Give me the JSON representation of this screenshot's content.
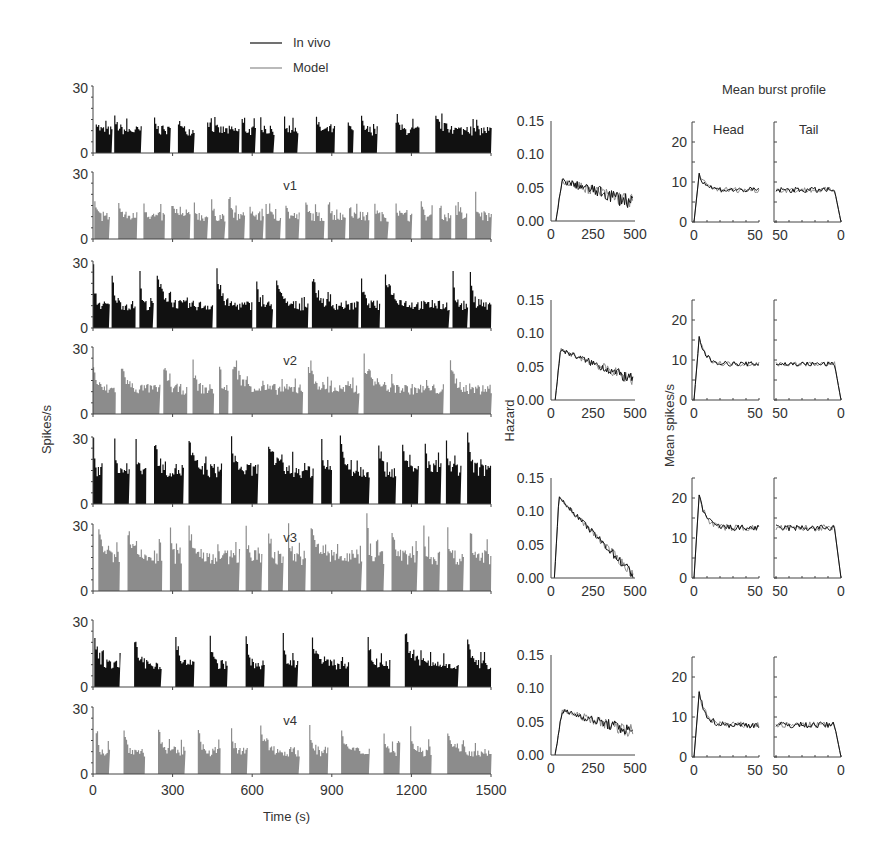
{
  "chart_data": [
    {
      "type": "bar",
      "title": "Spike rate histograms (in vivo vs model)",
      "xlabel": "Time (s)",
      "ylabel": "Spikes/s",
      "xlim": [
        0,
        1500
      ],
      "ylim": [
        0,
        30
      ],
      "xticks": [
        0,
        300,
        600,
        900,
        1200,
        1500
      ],
      "yticks": [
        0,
        30
      ],
      "legend": [
        {
          "name": "In vivo",
          "color": "#111111"
        },
        {
          "name": "Model",
          "color": "#8c8c8c"
        }
      ],
      "panels": [
        {
          "group": "v1",
          "series": "In vivo",
          "level": 10,
          "peak": 15,
          "bursts": [
            [
              10,
              70
            ],
            [
              80,
              180
            ],
            [
              230,
              290
            ],
            [
              320,
              380
            ],
            [
              430,
              550
            ],
            [
              560,
              610
            ],
            [
              630,
              680
            ],
            [
              720,
              770
            ],
            [
              840,
              910
            ],
            [
              960,
              980
            ],
            [
              1010,
              1070
            ],
            [
              1140,
              1230
            ],
            [
              1290,
              1500
            ]
          ]
        },
        {
          "group": "v1",
          "series": "Model",
          "level": 10,
          "peak": 16,
          "bursts": [
            [
              5,
              60
            ],
            [
              95,
              165
            ],
            [
              190,
              270
            ],
            [
              295,
              365
            ],
            [
              380,
              430
            ],
            [
              445,
              495
            ],
            [
              510,
              570
            ],
            [
              590,
              640
            ],
            [
              650,
              705
            ],
            [
              725,
              775
            ],
            [
              800,
              870
            ],
            [
              885,
              950
            ],
            [
              965,
              1040
            ],
            [
              1060,
              1110
            ],
            [
              1140,
              1200
            ],
            [
              1235,
              1280
            ],
            [
              1305,
              1350
            ],
            [
              1365,
              1410
            ],
            [
              1440,
              1500
            ]
          ]
        },
        {
          "group": "v2",
          "series": "In vivo",
          "level": 10,
          "peak": 23,
          "bursts": [
            [
              0,
              60
            ],
            [
              70,
              160
            ],
            [
              175,
              225
            ],
            [
              240,
              450
            ],
            [
              465,
              600
            ],
            [
              615,
              675
            ],
            [
              690,
              810
            ],
            [
              825,
              1000
            ],
            [
              1010,
              1080
            ],
            [
              1100,
              1340
            ],
            [
              1355,
              1410
            ],
            [
              1420,
              1500
            ]
          ]
        },
        {
          "group": "v2",
          "series": "Model",
          "level": 11,
          "peak": 22,
          "bursts": [
            [
              0,
              85
            ],
            [
              105,
              250
            ],
            [
              265,
              355
            ],
            [
              375,
              455
            ],
            [
              475,
              510
            ],
            [
              525,
              790
            ],
            [
              810,
              1000
            ],
            [
              1020,
              1320
            ],
            [
              1345,
              1500
            ]
          ]
        },
        {
          "group": "v3",
          "series": "In vivo",
          "level": 15,
          "peak": 29,
          "bursts": [
            [
              0,
              35
            ],
            [
              80,
              135
            ],
            [
              160,
              200
            ],
            [
              230,
              340
            ],
            [
              360,
              485
            ],
            [
              520,
              620
            ],
            [
              660,
              830
            ],
            [
              860,
              900
            ],
            [
              930,
              1040
            ],
            [
              1075,
              1140
            ],
            [
              1165,
              1225
            ],
            [
              1250,
              1310
            ],
            [
              1330,
              1385
            ],
            [
              1410,
              1500
            ]
          ]
        },
        {
          "group": "v3",
          "series": "Model",
          "level": 15,
          "peak": 27,
          "bursts": [
            [
              20,
              100
            ],
            [
              130,
              260
            ],
            [
              290,
              335
            ],
            [
              360,
              550
            ],
            [
              575,
              635
            ],
            [
              660,
              715
            ],
            [
              735,
              800
            ],
            [
              820,
              1010
            ],
            [
              1030,
              1095
            ],
            [
              1125,
              1220
            ],
            [
              1245,
              1305
            ],
            [
              1335,
              1395
            ],
            [
              1420,
              1500
            ]
          ]
        },
        {
          "group": "v4",
          "series": "In vivo",
          "level": 10,
          "peak": 22,
          "bursts": [
            [
              5,
              100
            ],
            [
              155,
              255
            ],
            [
              310,
              380
            ],
            [
              440,
              505
            ],
            [
              575,
              645
            ],
            [
              715,
              770
            ],
            [
              825,
              965
            ],
            [
              1035,
              1120
            ],
            [
              1175,
              1375
            ],
            [
              1410,
              1500
            ]
          ]
        },
        {
          "group": "v4",
          "series": "Model",
          "level": 10,
          "peak": 20,
          "bursts": [
            [
              10,
              60
            ],
            [
              115,
              195
            ],
            [
              245,
              345
            ],
            [
              395,
              480
            ],
            [
              520,
              580
            ],
            [
              630,
              775
            ],
            [
              815,
              885
            ],
            [
              935,
              1040
            ],
            [
              1095,
              1155
            ],
            [
              1195,
              1275
            ],
            [
              1335,
              1500
            ]
          ]
        }
      ]
    },
    {
      "type": "line",
      "title": "Hazard",
      "ylabel": "Hazard",
      "xlim": [
        0,
        500
      ],
      "ylim": [
        0,
        0.15
      ],
      "xticks": [
        0,
        250,
        500
      ],
      "yticks": [
        0.0,
        0.05,
        0.1,
        0.15
      ],
      "rows": [
        {
          "group": "v1",
          "onset": 30,
          "peak_x": 70,
          "peak": 0.06,
          "end": 0.028,
          "noise": 0.01
        },
        {
          "group": "v2",
          "onset": 25,
          "peak_x": 60,
          "peak": 0.075,
          "end": 0.03,
          "noise": 0.007
        },
        {
          "group": "v3",
          "onset": 20,
          "peak_x": 50,
          "peak": 0.12,
          "end": 0.005,
          "noise": 0.006
        },
        {
          "group": "v4",
          "onset": 25,
          "peak_x": 70,
          "peak": 0.066,
          "end": 0.035,
          "noise": 0.008
        }
      ]
    },
    {
      "type": "line",
      "title": "Mean burst profile",
      "ylabel": "Mean spikes/s",
      "ylim": [
        0,
        25
      ],
      "yticks": [
        0,
        10,
        20
      ],
      "subpanels": [
        {
          "name": "Head",
          "xlim": [
            0,
            50
          ],
          "xticks": [
            0,
            50
          ]
        },
        {
          "name": "Tail",
          "xlim": [
            50,
            0
          ],
          "xticks": [
            50,
            0
          ]
        }
      ],
      "rows": [
        {
          "group": "v1",
          "head_peak": 12,
          "plateau": 8,
          "noise": 0.7
        },
        {
          "group": "v2",
          "head_peak": 15.5,
          "plateau": 9,
          "noise": 0.6
        },
        {
          "group": "v3",
          "head_peak": 21,
          "plateau": 12.5,
          "noise": 0.8
        },
        {
          "group": "v4",
          "head_peak": 16,
          "plateau": 8,
          "noise": 0.8
        }
      ]
    }
  ],
  "labels": {
    "legend_invivo": "In vivo",
    "legend_model": "Model",
    "y_spikes": "Spikes/s",
    "x_time": "Time (s)",
    "y_hazard": "Hazard",
    "y_mean": "Mean spikes/s",
    "burst_title": "Mean burst profile",
    "head": "Head",
    "tail": "Tail",
    "groups": [
      "v1",
      "v2",
      "v3",
      "v4"
    ],
    "tick_30": "30",
    "tick_0": "0",
    "time_ticks": [
      "0",
      "300",
      "600",
      "900",
      "1200",
      "1500"
    ],
    "hazard_yticks": [
      "0.15",
      "0.10",
      "0.05",
      "0.00"
    ],
    "hazard_xticks": [
      "0",
      "250",
      "500"
    ],
    "mean_yticks": [
      "20",
      "10",
      "0"
    ],
    "head_xticks": [
      "0",
      "50"
    ],
    "tail_xticks": [
      "50",
      "0"
    ]
  },
  "colors": {
    "invivo": "#111111",
    "model": "#8c8c8c",
    "axis": "#444444",
    "text": "#333333"
  }
}
